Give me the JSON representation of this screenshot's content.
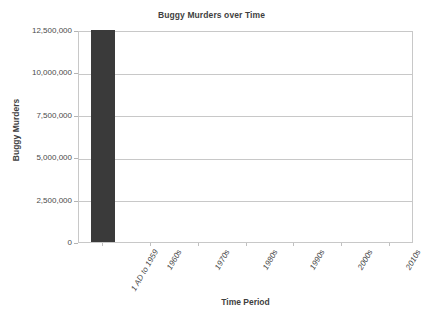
{
  "chart_data": {
    "type": "bar",
    "title": "Buggy Murders over Time",
    "xlabel": "Time Period",
    "ylabel": "Buggy Murders",
    "categories": [
      "1 AD to 1959",
      "1960s",
      "1970s",
      "1980s",
      "1990s",
      "2000s",
      "2010s"
    ],
    "values": [
      12500000,
      0,
      0,
      0,
      0,
      0,
      0
    ],
    "ylim": [
      0,
      12500000
    ],
    "ytick_labels": [
      "0",
      "2,500,000",
      "5,000,000",
      "7,500,000",
      "10,000,000",
      "12,500,000"
    ],
    "ytick_values": [
      0,
      2500000,
      5000000,
      7500000,
      10000000,
      12500000
    ],
    "grid": "horizontal",
    "legend": "none",
    "bar_color": "#3a3a3a",
    "grid_color": "#c8c8c8",
    "axis_color": "#c8c8c8",
    "text_color": "#404040"
  }
}
